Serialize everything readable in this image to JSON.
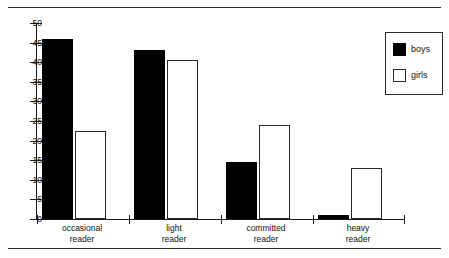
{
  "figure": {
    "top_rule": true,
    "bottom_rule": true
  },
  "legend": {
    "position": "top-right",
    "entries": [
      {
        "label": "boys",
        "swatch": "filled-square-icon",
        "color": "#000000"
      },
      {
        "label": "girls",
        "swatch": "hollow-square-icon",
        "color": "#ffffff"
      }
    ]
  },
  "axis": {
    "y_ticks": [
      "0",
      "5",
      "10",
      "15",
      "20",
      "25",
      "30",
      "35",
      "40",
      "45",
      "50"
    ],
    "x_labels": [
      {
        "line1": "occasional",
        "line2": "reader"
      },
      {
        "line1": "light",
        "line2": "reader"
      },
      {
        "line1": "committed",
        "line2": "reader"
      },
      {
        "line1": "heavy",
        "line2": "reader"
      }
    ]
  },
  "chart_data": {
    "type": "bar",
    "title": "",
    "subtitle": "",
    "xlabel": "",
    "ylabel": "",
    "ylim": [
      0,
      50
    ],
    "ytick_step": 5,
    "grid": false,
    "legend_position": "top-right",
    "categories": [
      "occasional reader",
      "light reader",
      "committed reader",
      "heavy reader"
    ],
    "series": [
      {
        "name": "boys",
        "color": "#000000",
        "values": [
          46,
          43,
          14.5,
          1
        ]
      },
      {
        "name": "girls",
        "color": "#ffffff",
        "values": [
          22.5,
          40.5,
          24,
          13
        ]
      }
    ]
  }
}
